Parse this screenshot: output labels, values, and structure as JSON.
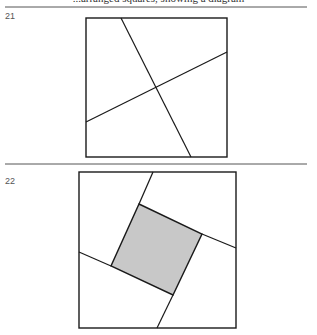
{
  "page": {
    "top_text_fragment": "...arranged squares, showing a diagram",
    "separators": [
      {
        "y": 7,
        "x1": 5,
        "x2": 307
      },
      {
        "y": 164,
        "x1": 5,
        "x2": 307
      }
    ]
  },
  "figures": [
    {
      "number": "21",
      "label_pos": {
        "x": 5,
        "y": 11
      },
      "square": {
        "x": 86,
        "y": 18,
        "w": 141,
        "h": 139
      },
      "lines": [
        {
          "x1": 121,
          "y1": 18,
          "x2": 191,
          "y2": 157
        },
        {
          "x1": 86,
          "y1": 122,
          "x2": 227,
          "y2": 52
        }
      ]
    },
    {
      "number": "22",
      "label_pos": {
        "x": 5,
        "y": 176
      },
      "square": {
        "x": 79,
        "y": 172,
        "w": 157,
        "h": 156
      },
      "shaded_square": {
        "points": "139,204 202,234 173,295 111,266",
        "fill": "#c8c8c8"
      },
      "lines": [
        {
          "x1": 153,
          "y1": 172,
          "x2": 139,
          "y2": 204
        },
        {
          "x1": 202,
          "y1": 234,
          "x2": 236,
          "y2": 248
        },
        {
          "x1": 173,
          "y1": 295,
          "x2": 157,
          "y2": 328
        },
        {
          "x1": 79,
          "y1": 252,
          "x2": 111,
          "y2": 266
        }
      ]
    }
  ],
  "colors": {
    "stroke": "#1a1a1a",
    "separator": "#555555",
    "shade": "#c8c8c8"
  }
}
